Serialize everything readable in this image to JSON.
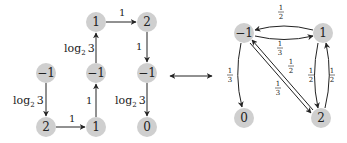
{
  "left_graph": {
    "nodes": [
      {
        "id": "a",
        "label": "−1",
        "x": 46,
        "y": 73
      },
      {
        "id": "b",
        "label": "2",
        "x": 46,
        "y": 127
      },
      {
        "id": "c",
        "label": "1",
        "x": 96,
        "y": 127
      },
      {
        "id": "d",
        "label": "−1",
        "x": 96,
        "y": 73
      },
      {
        "id": "e",
        "label": "1",
        "x": 96,
        "y": 22
      },
      {
        "id": "f",
        "label": "2",
        "x": 147,
        "y": 22
      },
      {
        "id": "g",
        "label": "−1",
        "x": 147,
        "y": 73
      },
      {
        "id": "h",
        "label": "0",
        "x": 147,
        "y": 127
      }
    ],
    "edges": [
      {
        "from": "a",
        "to": "b",
        "label": "log₂ 3"
      },
      {
        "from": "b",
        "to": "c",
        "label": "1"
      },
      {
        "from": "c",
        "to": "d",
        "label": "1"
      },
      {
        "from": "d",
        "to": "e",
        "label": "log₂ 3"
      },
      {
        "from": "e",
        "to": "f",
        "label": "1"
      },
      {
        "from": "f",
        "to": "g",
        "label": "1"
      },
      {
        "from": "g",
        "to": "h",
        "label": "log₂ 3"
      }
    ]
  },
  "connector": {
    "symbol": "double-arrow",
    "meaning": "equivalence"
  },
  "right_graph": {
    "nodes": [
      {
        "id": "m1",
        "label": "−1",
        "x": 244,
        "y": 33
      },
      {
        "id": "p1",
        "label": "1",
        "x": 323,
        "y": 33
      },
      {
        "id": "z0",
        "label": "0",
        "x": 244,
        "y": 118
      },
      {
        "id": "t2",
        "label": "2",
        "x": 321,
        "y": 118
      }
    ],
    "edges": [
      {
        "from": "p1",
        "to": "m1",
        "label": "1/2"
      },
      {
        "from": "m1",
        "to": "p1",
        "label": "1/3"
      },
      {
        "from": "m1",
        "to": "z0",
        "label": "1/3"
      },
      {
        "from": "t2",
        "to": "m1",
        "label": "1/2"
      },
      {
        "from": "m1",
        "to": "t2",
        "label": "1/3"
      },
      {
        "from": "p1",
        "to": "t2",
        "label": "1/2"
      },
      {
        "from": "t2",
        "to": "p1",
        "label": "1/2"
      }
    ]
  },
  "text": {
    "left": {
      "n_a": "−1",
      "n_b": "2",
      "n_c": "1",
      "n_d": "−1",
      "n_e": "1",
      "n_f": "2",
      "n_g": "−1",
      "n_h": "0",
      "e_ab": "log",
      "e_ab_sub": "2",
      "e_ab_3": "3",
      "e_bc": "1",
      "e_cd": "1",
      "e_de": "log",
      "e_de_sub": "2",
      "e_de_3": "3",
      "e_ef": "1",
      "e_fg": "1",
      "e_gh": "log",
      "e_gh_sub": "2",
      "e_gh_3": "3"
    },
    "right": {
      "n_m1": "−1",
      "n_p1": "1",
      "n_z0": "0",
      "n_t2": "2",
      "one": "1",
      "two": "2",
      "three": "3"
    }
  }
}
